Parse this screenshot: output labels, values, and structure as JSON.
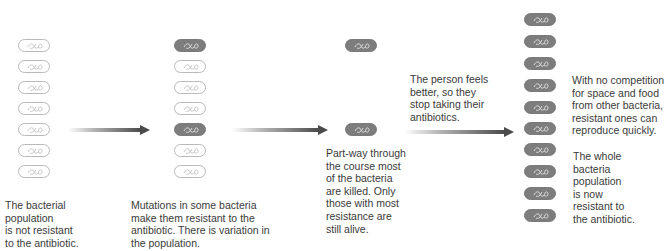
{
  "diagram": {
    "title_visible": false,
    "colors": {
      "susceptible_fill": "#ffffff",
      "susceptible_outline": "#b9b9b9",
      "resistant_fill": "#7d7d7d",
      "arrow": "#4a4a4a",
      "text": "#3a3a3a"
    },
    "stages": [
      {
        "id": "stage-1",
        "bacteria": [
          "susceptible",
          "susceptible",
          "susceptible",
          "susceptible",
          "susceptible",
          "susceptible",
          "susceptible"
        ],
        "caption": "The bacterial\npopulation\nis not resistant\nto the antibiotic."
      },
      {
        "id": "stage-2",
        "bacteria": [
          "resistant",
          "susceptible",
          "susceptible",
          "susceptible",
          "resistant",
          "susceptible",
          "susceptible"
        ],
        "caption": "Mutations in some bacteria\nmake them resistant to the\nantibiotic. There is variation in\nthe population."
      },
      {
        "id": "stage-3",
        "bacteria": [
          "resistant",
          "resistant"
        ],
        "caption": "Part-way through\nthe course most\nof the bacteria\nare killed. Only\nthose with most\nresistance are\nstill alive."
      },
      {
        "id": "stage-4",
        "bacteria": [
          "resistant",
          "resistant",
          "resistant",
          "resistant",
          "resistant",
          "resistant",
          "resistant",
          "resistant",
          "resistant",
          "resistant"
        ],
        "caption_top": "With no competition\nfor space and food\nfrom other bacteria,\nresistant ones can\nreproduce quickly.",
        "caption_bottom": "The whole\nbacteria\npopulation\nis now\nresistant to\nthe antibiotic."
      }
    ],
    "transition_caption": "The person feels\nbetter, so they\nstop taking their\nantibiotics.",
    "arrows": [
      {
        "from": "stage-1",
        "to": "stage-2"
      },
      {
        "from": "stage-2",
        "to": "stage-3"
      },
      {
        "from": "stage-3",
        "to": "stage-4"
      }
    ]
  }
}
